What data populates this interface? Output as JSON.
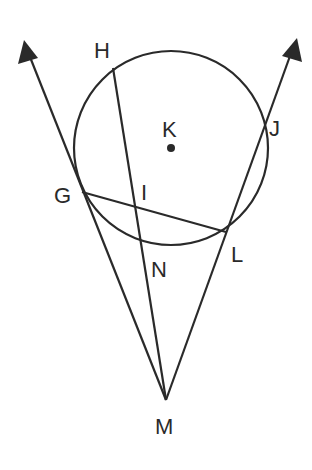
{
  "diagram": {
    "stroke_color": "#2a2a2a",
    "background": "#ffffff",
    "circle": {
      "name": "K",
      "cx": 171,
      "cy": 148,
      "r": 97
    },
    "points": {
      "K": {
        "label": "K",
        "x": 171,
        "y": 148,
        "label_x": 162,
        "label_y": 137
      },
      "H": {
        "label": "H",
        "x": 113,
        "y": 68,
        "label_x": 94,
        "label_y": 58
      },
      "J": {
        "label": "J",
        "x": 265,
        "y": 122,
        "label_x": 269,
        "label_y": 136
      },
      "G": {
        "label": "G",
        "x": 82,
        "y": 192,
        "label_x": 54,
        "label_y": 203
      },
      "I": {
        "label": "I",
        "x": 135,
        "y": 206,
        "label_x": 141,
        "label_y": 200
      },
      "L": {
        "label": "L",
        "x": 226,
        "y": 232,
        "label_x": 231,
        "label_y": 262
      },
      "N": {
        "label": "N",
        "x": 144,
        "y": 250,
        "label_x": 151,
        "label_y": 277
      },
      "M": {
        "label": "M",
        "x": 166,
        "y": 400,
        "label_x": 155,
        "label_y": 434
      }
    },
    "segments": [
      {
        "name": "ray-M-G",
        "from": "M",
        "to_x": 24,
        "to_y": 44,
        "arrow": true
      },
      {
        "name": "ray-M-J",
        "from": "M",
        "to_x": 296,
        "to_y": 42,
        "arrow": true
      },
      {
        "name": "segment-H-M",
        "from": "H",
        "to": "M"
      },
      {
        "name": "chord-G-L",
        "from": "G",
        "to": "L"
      }
    ],
    "labels": [
      "H",
      "K",
      "J",
      "G",
      "I",
      "L",
      "N",
      "M"
    ]
  }
}
